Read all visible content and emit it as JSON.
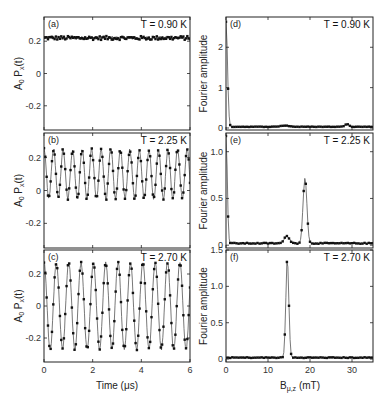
{
  "chart_data": [
    {
      "panel": "(a)",
      "type": "line",
      "annotation": "T = 0.90 K",
      "xlabel": "",
      "ylabel": "A0 Px(t)",
      "xlim": [
        0,
        6
      ],
      "ylim": [
        -0.35,
        0.35
      ],
      "xticks": [
        0,
        2,
        4,
        6
      ],
      "yticks": [
        -0.2,
        0,
        0.2
      ],
      "yticklabels": [
        "-0.2",
        "0",
        "0.2"
      ],
      "series": [
        {
          "name": "data + fit",
          "model": "constant",
          "offset": 0.22,
          "amplitude": 0.0,
          "frequency_MHz": 0,
          "noise": 0.012
        }
      ]
    },
    {
      "panel": "(b)",
      "type": "line",
      "annotation": "T = 2.25 K",
      "xlabel": "",
      "ylabel": "A0 Px(t)",
      "xlim": [
        0,
        6
      ],
      "ylim": [
        -0.35,
        0.35
      ],
      "xticks": [
        0,
        2,
        4,
        6
      ],
      "yticks": [
        -0.2,
        0,
        0.2
      ],
      "yticklabels": [
        "-0.2",
        "0",
        "0.2"
      ],
      "series": [
        {
          "name": "data + fit",
          "model": "cosine",
          "offset": 0.1,
          "amplitude": 0.15,
          "frequency_MHz": 2.55,
          "noise": 0.01
        }
      ]
    },
    {
      "panel": "(c)",
      "type": "line",
      "annotation": "T = 2.70 K",
      "xlabel": "Time (μs)",
      "ylabel": "A0 Px(t)",
      "xlim": [
        0,
        6
      ],
      "ylim": [
        -0.35,
        0.35
      ],
      "xticks": [
        0,
        2,
        4,
        6
      ],
      "xticklabels": [
        "0",
        "2",
        "4",
        "6"
      ],
      "yticks": [
        -0.2,
        0,
        0.2
      ],
      "yticklabels": [
        "-0.2",
        "0",
        "0.2"
      ],
      "series": [
        {
          "name": "data + fit",
          "model": "cosine",
          "offset": 0.0,
          "amplitude": 0.27,
          "frequency_MHz": 1.97,
          "noise": 0.008
        }
      ]
    },
    {
      "panel": "(d)",
      "type": "line",
      "annotation": "T = 0.90 K",
      "xlabel": "",
      "ylabel": "Fourier amplitude",
      "xlim": [
        0,
        35
      ],
      "ylim": [
        -0.05,
        2.75
      ],
      "xticks": [
        0,
        10,
        20,
        30
      ],
      "yticks": [
        0,
        1,
        2
      ],
      "yticklabels": [
        "0",
        "1",
        "2"
      ],
      "peaks": [
        {
          "center_mT": 0.0,
          "height": 2.6,
          "width": 0.35
        },
        {
          "center_mT": 14.0,
          "height": 0.03,
          "width": 1.0
        },
        {
          "center_mT": 28.8,
          "height": 0.07,
          "width": 0.5
        }
      ],
      "baseline": 0.03
    },
    {
      "panel": "(e)",
      "type": "line",
      "annotation": "T = 2.25 K",
      "xlabel": "",
      "ylabel": "Fourier amplitude",
      "xlim": [
        0,
        35
      ],
      "ylim": [
        -0.03,
        1.2
      ],
      "xticks": [
        0,
        10,
        20,
        30
      ],
      "yticks": [
        0,
        0.5,
        1.0
      ],
      "yticklabels": [
        "0",
        "0.5",
        "1.0"
      ],
      "peaks": [
        {
          "center_mT": 0.0,
          "height": 1.15,
          "width": 0.3
        },
        {
          "center_mT": 14.5,
          "height": 0.08,
          "width": 0.6
        },
        {
          "center_mT": 18.8,
          "height": 0.7,
          "width": 0.45
        }
      ],
      "baseline": 0.02
    },
    {
      "panel": "(f)",
      "type": "line",
      "annotation": "T = 2.70 K",
      "xlabel": "Bμ,z (mT)",
      "ylabel": "Fourier amplitude",
      "xlim": [
        0,
        35
      ],
      "ylim": [
        -0.04,
        1.5
      ],
      "xticks": [
        0,
        10,
        20,
        30
      ],
      "xticklabels": [
        "0",
        "10",
        "20",
        "30"
      ],
      "yticks": [
        0,
        0.5,
        1.0,
        1.5
      ],
      "yticklabels": [
        "0",
        "0.5",
        "1.0",
        "1.5"
      ],
      "peaks": [
        {
          "center_mT": 14.6,
          "height": 1.37,
          "width": 0.35
        }
      ],
      "baseline": 0.02
    }
  ],
  "labels": {
    "time_axis": "Time (μs)",
    "field_axis_main": "B",
    "field_axis_sub": "μ,z",
    "field_axis_unit": " (mT)",
    "left_ylabel_main": "A",
    "left_ylabel_sub0": "0",
    "left_ylabel_mid": " P",
    "left_ylabel_sub1": "x",
    "left_ylabel_end": "(t)",
    "right_ylabel": "Fourier amplitude"
  },
  "style": {
    "line_color": "#555555",
    "marker_color": "#111111",
    "frame_color": "#222222"
  }
}
